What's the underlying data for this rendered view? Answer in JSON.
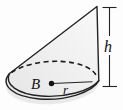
{
  "figure": {
    "type": "oblique-cone-diagram",
    "labels": {
      "base_center": "B",
      "radius": "r",
      "height": "h"
    },
    "colors": {
      "outline": "#232323",
      "cone_fill_light": "#f9f9f9",
      "cone_fill_dark": "#e6e6e6",
      "base_fill": "#e9e9e9",
      "dot": "#111111",
      "background": "#fdfdfd"
    }
  }
}
